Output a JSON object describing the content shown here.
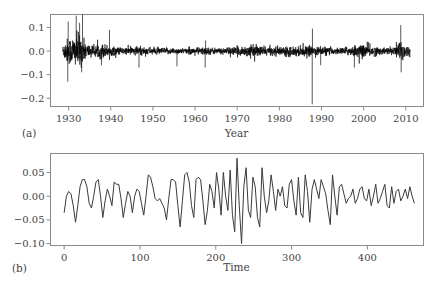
{
  "chart_data": [
    {
      "panel": "(a)",
      "type": "line",
      "title": "",
      "xlabel": "Year",
      "ylabel": "",
      "xlim": [
        1925.7,
        2014.2
      ],
      "ylim": [
        -0.235,
        0.155
      ],
      "xticks": [
        1930,
        1940,
        1950,
        1960,
        1970,
        1980,
        1990,
        2000,
        2010
      ],
      "yticks": [
        0.1,
        0.0,
        -0.1,
        -0.2
      ],
      "ytick_labels": [
        "0.1",
        "0.0",
        "−0.1",
        "−0.2"
      ],
      "grid": false,
      "series_description": "Daily returns, dense high-frequency series from ~1928.5 to ~2011",
      "x_start": 1928.6,
      "x_end": 2011.0,
      "volatility_profile": [
        {
          "x": 1928.6,
          "sigma": 0.012
        },
        {
          "x": 1929.5,
          "sigma": 0.025
        },
        {
          "x": 1931.0,
          "sigma": 0.03
        },
        {
          "x": 1932.5,
          "sigma": 0.035
        },
        {
          "x": 1934.0,
          "sigma": 0.018
        },
        {
          "x": 1936.0,
          "sigma": 0.01
        },
        {
          "x": 1938.0,
          "sigma": 0.016
        },
        {
          "x": 1940.0,
          "sigma": 0.01
        },
        {
          "x": 1943.0,
          "sigma": 0.007
        },
        {
          "x": 1946.0,
          "sigma": 0.01
        },
        {
          "x": 1950.0,
          "sigma": 0.007
        },
        {
          "x": 1958.0,
          "sigma": 0.006
        },
        {
          "x": 1962.0,
          "sigma": 0.008
        },
        {
          "x": 1966.0,
          "sigma": 0.006
        },
        {
          "x": 1970.0,
          "sigma": 0.009
        },
        {
          "x": 1974.0,
          "sigma": 0.012
        },
        {
          "x": 1978.0,
          "sigma": 0.008
        },
        {
          "x": 1982.0,
          "sigma": 0.01
        },
        {
          "x": 1987.0,
          "sigma": 0.01
        },
        {
          "x": 1990.0,
          "sigma": 0.009
        },
        {
          "x": 1994.0,
          "sigma": 0.006
        },
        {
          "x": 1998.0,
          "sigma": 0.012
        },
        {
          "x": 2001.0,
          "sigma": 0.014
        },
        {
          "x": 2004.0,
          "sigma": 0.007
        },
        {
          "x": 2007.0,
          "sigma": 0.008
        },
        {
          "x": 2008.8,
          "sigma": 0.025
        },
        {
          "x": 2010.0,
          "sigma": 0.013
        },
        {
          "x": 2011.0,
          "sigma": 0.01
        }
      ],
      "spikes": [
        {
          "x": 1929.8,
          "y": -0.13
        },
        {
          "x": 1929.9,
          "y": 0.125
        },
        {
          "x": 1931.8,
          "y": 0.15
        },
        {
          "x": 1932.6,
          "y": 0.12
        },
        {
          "x": 1933.3,
          "y": 0.155
        },
        {
          "x": 1933.1,
          "y": -0.09
        },
        {
          "x": 1937.8,
          "y": -0.06
        },
        {
          "x": 1939.7,
          "y": 0.09
        },
        {
          "x": 1946.7,
          "y": -0.07
        },
        {
          "x": 1955.7,
          "y": -0.065
        },
        {
          "x": 1962.4,
          "y": -0.07
        },
        {
          "x": 1962.5,
          "y": 0.045
        },
        {
          "x": 1987.8,
          "y": -0.226
        },
        {
          "x": 1987.85,
          "y": 0.095
        },
        {
          "x": 1989.8,
          "y": -0.06
        },
        {
          "x": 1997.8,
          "y": -0.07
        },
        {
          "x": 2008.8,
          "y": 0.11
        },
        {
          "x": 2008.9,
          "y": -0.09
        }
      ]
    },
    {
      "panel": "(b)",
      "type": "line",
      "title": "",
      "xlabel": "Time",
      "ylabel": "",
      "xlim": [
        -18,
        474
      ],
      "ylim": [
        -0.104,
        0.09
      ],
      "xticks": [
        0,
        100,
        200,
        300,
        400
      ],
      "yticks": [
        0.05,
        0.0,
        -0.05,
        -0.1
      ],
      "ytick_labels": [
        "0.05",
        "0.00",
        "−0.05",
        "−0.10"
      ],
      "grid": false,
      "x_step": 3,
      "values": [
        -0.035,
        0.0,
        0.01,
        0.005,
        -0.02,
        -0.055,
        -0.02,
        0.02,
        0.035,
        0.035,
        0.02,
        -0.015,
        -0.025,
        0.0,
        0.03,
        0.035,
        0.0,
        -0.045,
        -0.01,
        0.015,
        0.0,
        -0.02,
        0.03,
        0.025,
        0.025,
        -0.005,
        -0.045,
        -0.015,
        0.01,
        0.0,
        -0.035,
        0.0,
        0.015,
        0.01,
        -0.015,
        -0.04,
        0.0,
        0.045,
        0.04,
        0.02,
        -0.005,
        -0.01,
        -0.005,
        -0.015,
        -0.025,
        -0.05,
        -0.005,
        0.035,
        0.035,
        0.03,
        -0.02,
        -0.065,
        -0.01,
        0.045,
        0.05,
        0.03,
        -0.02,
        -0.045,
        0.035,
        0.04,
        0.035,
        -0.01,
        -0.06,
        -0.03,
        0.025,
        0.01,
        -0.025,
        0.05,
        0.015,
        -0.04,
        0.05,
        0.0,
        -0.03,
        0.055,
        -0.04,
        -0.075,
        0.08,
        -0.02,
        -0.1,
        0.02,
        0.06,
        -0.03,
        -0.045,
        0.04,
        0.02,
        -0.045,
        -0.065,
        0.06,
        0.0,
        -0.035,
        -0.01,
        0.045,
        0.01,
        -0.03,
        0.015,
        0.0,
        0.02,
        -0.02,
        -0.025,
        0.025,
        0.035,
        -0.01,
        -0.04,
        0.04,
        -0.035,
        -0.045,
        0.045,
        0.01,
        -0.055,
        0.015,
        0.035,
        0.015,
        -0.005,
        0.035,
        0.02,
        0.005,
        -0.03,
        -0.06,
        0.045,
        0.0,
        -0.04,
        0.02,
        0.025,
        0.005,
        -0.015,
        -0.005,
        0.0,
        0.015,
        -0.015,
        -0.005,
        0.015,
        0.02,
        -0.005,
        -0.01,
        0.015,
        -0.02,
        0.0,
        0.025,
        -0.015,
        -0.005,
        0.01,
        0.025,
        -0.02,
        -0.025,
        0.02,
        -0.015,
        0.01,
        0.015,
        -0.01,
        0.0,
        0.015,
        -0.005,
        0.02,
        0.0,
        -0.015
      ],
      "stroke_color": "#3a3a3a",
      "frame_color": "#7a7a7a"
    }
  ],
  "panels": {
    "a": {
      "tag": "(a)",
      "xlabel": "Year"
    },
    "b": {
      "tag": "(b)",
      "xlabel": "Time"
    }
  }
}
